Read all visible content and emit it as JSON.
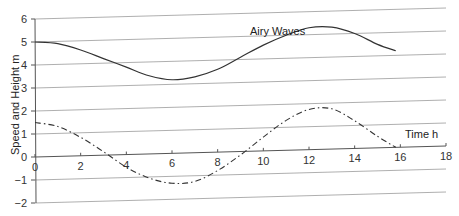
{
  "chart_data": {
    "type": "line",
    "title": "Airy Waves",
    "xlabel": "Time h",
    "ylabel": "Speed and Height m",
    "xlim": [
      0,
      18
    ],
    "ylim": [
      -2,
      6
    ],
    "x_ticks": [
      0,
      2,
      4,
      6,
      8,
      10,
      12,
      14,
      16,
      18
    ],
    "y_ticks": [
      -2,
      -1,
      0,
      1,
      2,
      3,
      4,
      5,
      6
    ],
    "grid": "horizontal",
    "legend": "none",
    "series": [
      {
        "name": "Height",
        "style": "solid",
        "x": [
          0,
          1,
          2,
          3,
          4,
          5,
          6,
          7,
          8,
          9,
          10,
          11,
          12,
          13,
          14,
          15,
          15.8
        ],
        "values": [
          5.0,
          4.9,
          4.6,
          4.2,
          3.8,
          3.4,
          3.2,
          3.3,
          3.6,
          4.1,
          4.6,
          5.0,
          5.3,
          5.3,
          5.0,
          4.5,
          4.2
        ]
      },
      {
        "name": "Speed",
        "style": "dash-dot",
        "x": [
          0,
          1,
          2,
          3,
          4,
          5,
          6,
          7,
          8,
          9,
          10,
          11,
          12,
          13,
          14,
          15,
          15.8
        ],
        "values": [
          1.5,
          1.3,
          0.8,
          0.15,
          -0.55,
          -1.05,
          -1.3,
          -1.25,
          -0.8,
          -0.15,
          0.6,
          1.3,
          1.75,
          1.75,
          1.2,
          0.5,
          0.0
        ]
      }
    ]
  }
}
